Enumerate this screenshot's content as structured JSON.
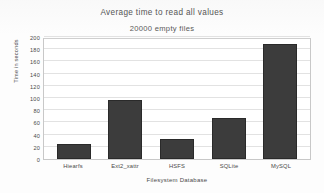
{
  "chart_data": {
    "type": "bar",
    "title": "Average time to read all values",
    "subtitle": "20000 empty files",
    "xlabel": "Filesystem Database",
    "ylabel": "Time in seconds",
    "categories": [
      "Hiearfs",
      "Ext2_xattr",
      "HSFS",
      "SQLite",
      "MySQL"
    ],
    "values": [
      24,
      96,
      32,
      68,
      188
    ],
    "ylim": [
      0,
      200
    ],
    "yticks": [
      0,
      20,
      40,
      60,
      80,
      100,
      120,
      140,
      160,
      180,
      200
    ],
    "ytick_labels": [
      "0",
      "20",
      "40",
      "60",
      "80",
      "100",
      "120",
      "140",
      "160",
      "180",
      "200"
    ],
    "grid": true,
    "legend": false,
    "bar_color": "#3c3c3c",
    "plot_background": "#ffffff",
    "grid_color": "#e2e2e2"
  }
}
